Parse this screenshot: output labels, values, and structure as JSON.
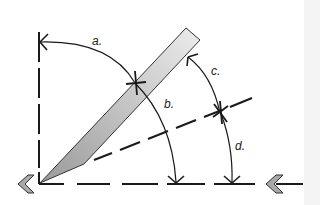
{
  "diagram": {
    "type": "angle-measurement-diagram",
    "labels": {
      "a": "a.",
      "b": "b.",
      "c": "c.",
      "d": "d."
    },
    "elements": {
      "blade": "gray tapered blade rising from lower-left at ~45 degrees",
      "baseline": "horizontal dashed reference line",
      "vertical": "vertical dashed reference line",
      "diagonal": "dashed bisector line",
      "arrows": [
        "left-pointing chevron at origin",
        "left-pointing chevron arrow at right"
      ]
    },
    "colors": {
      "line": "#1a1a1a",
      "blade_fill": "#b8b8b8",
      "blade_fill_light": "#e6e6e6",
      "chevron_fill": "#a9a9a9"
    }
  }
}
